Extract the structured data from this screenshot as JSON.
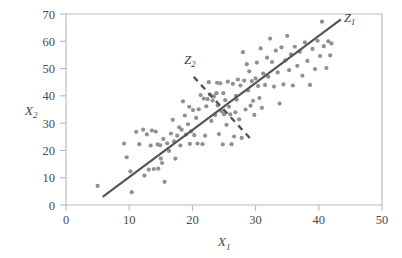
{
  "chart_data": {
    "type": "scatter",
    "title": "",
    "xlabel": "X1",
    "ylabel": "X2",
    "xlabel_base": "X",
    "xlabel_subscript": "1",
    "ylabel_base": "X",
    "ylabel_subscript": "2",
    "xlim": [
      0,
      50
    ],
    "ylim": [
      0,
      70
    ],
    "xticks": [
      0,
      10,
      20,
      30,
      40,
      50
    ],
    "yticks": [
      0,
      10,
      20,
      30,
      40,
      50,
      60,
      70
    ],
    "xtick_labels": [
      "0",
      "10",
      "20",
      "30",
      "40",
      "50"
    ],
    "ytick_labels": [
      "0",
      "10",
      "20",
      "30",
      "40",
      "50",
      "60",
      "70"
    ],
    "grid": false,
    "legend": "none",
    "point_color": "#909090",
    "line_color": "#555555",
    "frame_color": "#b9b9b9",
    "point_radius": 2.1,
    "series": [
      {
        "name": "observations",
        "points": [
          [
            5.0,
            7.0
          ],
          [
            9.2,
            22.5
          ],
          [
            9.6,
            17.5
          ],
          [
            10.2,
            12.3
          ],
          [
            10.4,
            4.7
          ],
          [
            11.1,
            26.8
          ],
          [
            11.6,
            22.3
          ],
          [
            12.2,
            27.6
          ],
          [
            12.4,
            10.8
          ],
          [
            12.8,
            25.9
          ],
          [
            13.1,
            13.0
          ],
          [
            13.4,
            21.8
          ],
          [
            13.6,
            27.3
          ],
          [
            13.9,
            13.2
          ],
          [
            14.2,
            26.9
          ],
          [
            14.5,
            22.2
          ],
          [
            14.6,
            13.3
          ],
          [
            14.9,
            21.9
          ],
          [
            15.0,
            17.0
          ],
          [
            15.2,
            15.4
          ],
          [
            15.4,
            24.2
          ],
          [
            15.6,
            8.5
          ],
          [
            16.0,
            22.6
          ],
          [
            16.3,
            19.8
          ],
          [
            16.6,
            26.2
          ],
          [
            16.9,
            31.2
          ],
          [
            17.1,
            23.3
          ],
          [
            17.3,
            17.0
          ],
          [
            17.6,
            25.4
          ],
          [
            17.9,
            28.5
          ],
          [
            18.1,
            21.8
          ],
          [
            18.3,
            27.6
          ],
          [
            18.5,
            38.0
          ],
          [
            18.8,
            32.8
          ],
          [
            19.0,
            25.8
          ],
          [
            19.3,
            29.6
          ],
          [
            19.6,
            22.4
          ],
          [
            19.8,
            27.0
          ],
          [
            20.1,
            34.8
          ],
          [
            20.3,
            25.6
          ],
          [
            20.6,
            31.9
          ],
          [
            20.8,
            22.5
          ],
          [
            21.0,
            35.1
          ],
          [
            21.3,
            40.3
          ],
          [
            21.6,
            22.3
          ],
          [
            21.8,
            39.0
          ],
          [
            22.0,
            25.4
          ],
          [
            22.2,
            36.2
          ],
          [
            22.4,
            38.8
          ],
          [
            22.6,
            45.0
          ],
          [
            22.8,
            40.4
          ],
          [
            23.0,
            30.8
          ],
          [
            23.2,
            38.3
          ],
          [
            23.4,
            39.8
          ],
          [
            23.6,
            33.0
          ],
          [
            23.8,
            41.0
          ],
          [
            24.0,
            36.5
          ],
          [
            24.2,
            26.0
          ],
          [
            24.4,
            44.6
          ],
          [
            24.6,
            34.4
          ],
          [
            24.8,
            22.2
          ],
          [
            25.0,
            33.3
          ],
          [
            25.2,
            38.4
          ],
          [
            25.4,
            29.4
          ],
          [
            25.6,
            45.2
          ],
          [
            25.8,
            36.0
          ],
          [
            26.0,
            33.2
          ],
          [
            26.2,
            22.3
          ],
          [
            26.4,
            44.4
          ],
          [
            26.6,
            25.1
          ],
          [
            26.8,
            34.0
          ],
          [
            27.0,
            38.6
          ],
          [
            27.2,
            46.0
          ],
          [
            27.4,
            31.4
          ],
          [
            27.6,
            43.8
          ],
          [
            27.8,
            24.6
          ],
          [
            28.0,
            56.0
          ],
          [
            28.2,
            45.6
          ],
          [
            28.4,
            35.0
          ],
          [
            28.6,
            51.6
          ],
          [
            28.8,
            42.0
          ],
          [
            29.0,
            49.0
          ],
          [
            29.2,
            36.4
          ],
          [
            29.4,
            45.4
          ],
          [
            29.6,
            38.2
          ],
          [
            29.8,
            33.0
          ],
          [
            30.0,
            46.4
          ],
          [
            30.2,
            52.2
          ],
          [
            30.4,
            43.6
          ],
          [
            30.6,
            39.2
          ],
          [
            30.8,
            57.4
          ],
          [
            31.2,
            48.2
          ],
          [
            31.5,
            44.0
          ],
          [
            31.8,
            54.0
          ],
          [
            32.0,
            47.0
          ],
          [
            32.3,
            61.0
          ],
          [
            32.6,
            52.4
          ],
          [
            32.9,
            43.4
          ],
          [
            33.2,
            56.6
          ],
          [
            33.5,
            48.6
          ],
          [
            33.8,
            37.2
          ],
          [
            34.1,
            57.8
          ],
          [
            34.4,
            44.2
          ],
          [
            34.7,
            53.0
          ],
          [
            35.0,
            62.0
          ],
          [
            35.3,
            49.4
          ],
          [
            35.6,
            55.2
          ],
          [
            35.9,
            43.8
          ],
          [
            36.2,
            58.0
          ],
          [
            36.6,
            51.0
          ],
          [
            37.0,
            56.2
          ],
          [
            37.4,
            47.4
          ],
          [
            37.8,
            59.6
          ],
          [
            38.2,
            52.8
          ],
          [
            38.6,
            44.0
          ],
          [
            39.0,
            57.2
          ],
          [
            39.4,
            49.8
          ],
          [
            39.8,
            60.2
          ],
          [
            40.2,
            54.6
          ],
          [
            40.5,
            67.2
          ],
          [
            40.8,
            58.2
          ],
          [
            41.2,
            50.2
          ],
          [
            41.5,
            60.0
          ],
          [
            41.8,
            54.8
          ],
          [
            42.0,
            59.2
          ],
          [
            19.5,
            36.0
          ],
          [
            23.9,
            44.8
          ],
          [
            26.9,
            40.0
          ],
          [
            31.0,
            35.6
          ],
          [
            24.9,
            41.0
          ]
        ]
      }
    ],
    "lines": [
      {
        "name": "Z1",
        "label": "Z1",
        "label_base": "Z",
        "label_subscript": "1",
        "style": "solid",
        "from": [
          5.8,
          3.0
        ],
        "to": [
          43.5,
          68.0
        ],
        "label_at": [
          44.0,
          67.0
        ]
      },
      {
        "name": "Z2",
        "label": "Z2",
        "label_base": "Z",
        "label_subscript": "2",
        "style": "dashed",
        "from": [
          20.2,
          47.0
        ],
        "to": [
          29.3,
          24.0
        ],
        "label_at": [
          18.7,
          51.5
        ]
      }
    ]
  }
}
